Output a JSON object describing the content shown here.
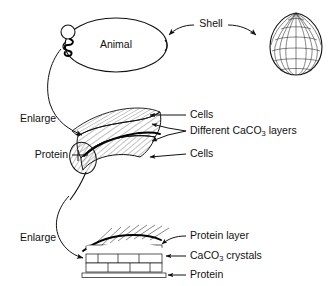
{
  "figure": {
    "background_color": "#ffffff",
    "ink_color": "#111111"
  },
  "labels": {
    "animal": "Animal",
    "shell": "Shell",
    "enlarge_1": "Enlarge",
    "enlarge_2": "Enlarge",
    "cells_upper": "Cells",
    "cells_lower": "Cells",
    "different_layers_prefix": "Different CaCO",
    "different_layers_sub": "3",
    "different_layers_suffix": " layers",
    "protein_mid": "Protein",
    "protein_layer": "Protein layer",
    "caco3_crystals_prefix": "CaCO",
    "caco3_crystals_sub": "3",
    "caco3_crystals_suffix": " crystals",
    "protein_bottom": "Protein"
  },
  "levels": [
    {
      "name": "organism",
      "parts": [
        "Animal",
        "Shell"
      ]
    },
    {
      "name": "shell-cross-section",
      "parts": [
        "Cells",
        "Different CaCO3 layers",
        "Cells",
        "Protein"
      ]
    },
    {
      "name": "microstructure",
      "parts": [
        "Protein layer",
        "CaCO3 crystals",
        "Protein"
      ]
    }
  ],
  "structure": {
    "brick_rows": 3,
    "dome_meridians": 9,
    "dome_latitudes": 6
  }
}
